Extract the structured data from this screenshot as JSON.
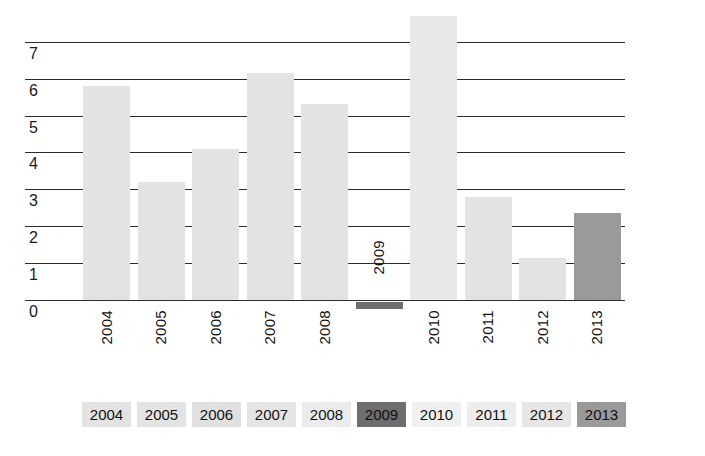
{
  "chart_data": {
    "type": "bar",
    "title": "",
    "subtitle": "",
    "xlabel": "",
    "ylabel": "",
    "categories": [
      "2004",
      "2005",
      "2006",
      "2007",
      "2008",
      "2009",
      "2010",
      "2011",
      "2012",
      "2013"
    ],
    "values": [
      5.8,
      3.2,
      4.1,
      6.15,
      5.3,
      -0.2,
      7.7,
      2.8,
      1.15,
      2.35
    ],
    "ylim": [
      0,
      7.7
    ],
    "yticks": [
      "0",
      "1",
      "2",
      "3",
      "4",
      "5",
      "6",
      "7"
    ],
    "ytick_values": [
      0,
      1,
      2,
      3,
      4,
      5,
      6,
      7
    ],
    "grid": true,
    "legend_position": "bottom",
    "bar_colors": [
      "#e3e3e3",
      "#e3e3e3",
      "#e3e3e3",
      "#e3e3e3",
      "#e3e3e3",
      "#6e6e6e",
      "#e8e8e8",
      "#e3e3e3",
      "#e3e3e3",
      "#9a9a9a"
    ],
    "series": [
      {
        "name": "values",
        "values": [
          5.8,
          3.2,
          4.1,
          6.15,
          5.3,
          -0.2,
          7.7,
          2.8,
          1.15,
          2.35
        ]
      }
    ],
    "annotations": [
      {
        "text": "2009",
        "note": "category label drawn inside plot area above the 2009 bar"
      }
    ]
  },
  "axis": {
    "ytick_labels": [
      "7",
      "6",
      "5",
      "4",
      "3",
      "2",
      "1",
      "0"
    ],
    "xtick_labels": [
      "2004",
      "2005",
      "2006",
      "2007",
      "2008",
      "2010",
      "2011",
      "2012",
      "2013"
    ],
    "inplot_label": "2009"
  },
  "legend": {
    "items": [
      {
        "label": "2004",
        "color": "#e3e3e3"
      },
      {
        "label": "2005",
        "color": "#e3e3e3"
      },
      {
        "label": "2006",
        "color": "#e0e0e0"
      },
      {
        "label": "2007",
        "color": "#e5e5e5"
      },
      {
        "label": "2008",
        "color": "#ebebeb"
      },
      {
        "label": "2009",
        "color": "#6e6e6e"
      },
      {
        "label": "2010",
        "color": "#f0f0f0"
      },
      {
        "label": "2011",
        "color": "#ededed"
      },
      {
        "label": "2012",
        "color": "#e6e6e6"
      },
      {
        "label": "2013",
        "color": "#9a9a9a"
      }
    ]
  },
  "colors": {
    "bar_light": "#e3e3e3",
    "bar_dark": "#6e6e6e",
    "bar_mid": "#9a9a9a",
    "grid": "#2b2b2b",
    "text": "#141414",
    "background": "#ffffff"
  }
}
